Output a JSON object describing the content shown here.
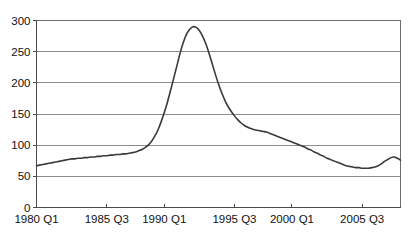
{
  "chart_data": {
    "type": "line",
    "title": "",
    "subtitle": "",
    "xlabel": "",
    "ylabel": "",
    "grid": true,
    "legend": false,
    "legend_position": "none",
    "line_color": "#3a3a3a",
    "grid_color": "#8c8c8c",
    "axis_color": "#4a4a4a",
    "background_color": "#ffffff",
    "ylim": [
      0,
      300
    ],
    "yticks": [
      0,
      50,
      100,
      150,
      200,
      250,
      300
    ],
    "ytick_labels": [
      "0",
      "50",
      "100",
      "150",
      "200",
      "250",
      "300"
    ],
    "xtick_labels": [
      "1980 Q1",
      "1985 Q3",
      "1990 Q1",
      "1995 Q3",
      "2000 Q1",
      "2005 Q3"
    ],
    "xtick_indices": [
      0,
      22,
      40,
      62,
      80,
      102
    ],
    "x_start_label": "1980 Q1",
    "x_end_label": "2008 Q3",
    "n_points": 115,
    "series": [
      {
        "name": "Index",
        "values": [
          67,
          68,
          69,
          70,
          71,
          72,
          73,
          74,
          75,
          76,
          77,
          78,
          78,
          79,
          79,
          80,
          80,
          81,
          81,
          82,
          82,
          83,
          83,
          84,
          84,
          85,
          85,
          86,
          86,
          87,
          88,
          89,
          91,
          93,
          96,
          100,
          106,
          114,
          124,
          137,
          152,
          169,
          188,
          208,
          228,
          248,
          265,
          278,
          286,
          290,
          289,
          284,
          275,
          263,
          248,
          231,
          214,
          198,
          184,
          172,
          162,
          154,
          147,
          141,
          136,
          132,
          129,
          127,
          125,
          124,
          123,
          122,
          121,
          119,
          117,
          115,
          113,
          111,
          109,
          107,
          105,
          103,
          101,
          99,
          97,
          94,
          92,
          89,
          87,
          84,
          82,
          79,
          77,
          75,
          73,
          71,
          69,
          67,
          66,
          65,
          64,
          64,
          63,
          63,
          63,
          64,
          65,
          67,
          70,
          74,
          77,
          80,
          81,
          79,
          76
        ]
      }
    ],
    "peak": {
      "value": 290,
      "label": "1990 Q1"
    },
    "start_value": 67,
    "end_value": 76,
    "min_value": 63
  }
}
